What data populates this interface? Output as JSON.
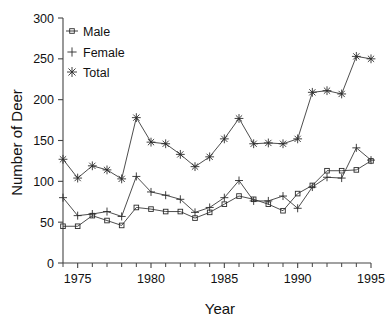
{
  "chart_data": {
    "type": "line",
    "title": "",
    "xlabel": "Year",
    "ylabel": "Number of Deer",
    "xlim": [
      1974,
      1995
    ],
    "ylim": [
      0,
      300
    ],
    "xticks": [
      1975,
      1980,
      1985,
      1990,
      1995
    ],
    "xtick_labels": [
      "1975",
      "1980",
      "1985",
      "1990",
      "1995"
    ],
    "xticks_minor_step": 1,
    "yticks": [
      0,
      50,
      100,
      150,
      200,
      250,
      300
    ],
    "ytick_labels": [
      "0",
      "50",
      "100",
      "150",
      "200",
      "250",
      "300"
    ],
    "grid": false,
    "legend_position": "top-left",
    "x": [
      1974,
      1975,
      1976,
      1977,
      1978,
      1979,
      1980,
      1981,
      1982,
      1983,
      1984,
      1985,
      1986,
      1987,
      1988,
      1989,
      1990,
      1991,
      1992,
      1993,
      1994,
      1995
    ],
    "series": [
      {
        "name": "Male",
        "marker": "square",
        "values": [
          45,
          45,
          58,
          52,
          46,
          68,
          66,
          63,
          63,
          55,
          62,
          72,
          82,
          78,
          72,
          64,
          85,
          95,
          113,
          113,
          114,
          125
        ]
      },
      {
        "name": "Female",
        "marker": "plus",
        "values": [
          80,
          58,
          60,
          63,
          57,
          106,
          87,
          83,
          78,
          62,
          68,
          80,
          101,
          76,
          76,
          82,
          67,
          93,
          105,
          104,
          141,
          126
        ]
      },
      {
        "name": "Total",
        "marker": "asterisk",
        "values": [
          127,
          104,
          119,
          114,
          103,
          178,
          148,
          146,
          133,
          118,
          130,
          152,
          177,
          146,
          147,
          146,
          152,
          209,
          211,
          207,
          253,
          250
        ]
      }
    ]
  },
  "legend": {
    "items": [
      {
        "label": "Male",
        "marker": "square"
      },
      {
        "label": "Female",
        "marker": "plus"
      },
      {
        "label": "Total",
        "marker": "asterisk"
      }
    ]
  }
}
